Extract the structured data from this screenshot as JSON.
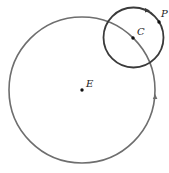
{
  "diagram": {
    "type": "orbital-circles",
    "colors": {
      "large_circle": "#6e6e6e",
      "small_circle": "#3a3a3a",
      "points": "#111111",
      "labels": "#222222",
      "background": "#ffffff"
    },
    "large_circle": {
      "cx": 82,
      "cy": 90,
      "r": 73,
      "center_label": "E"
    },
    "small_circle": {
      "cx": 133.5,
      "cy": 37.5,
      "r": 30,
      "center_label": "C"
    },
    "points": [
      {
        "name": "E",
        "x": 82,
        "y": 90,
        "label": "E",
        "label_x": 86,
        "label_y": 87
      },
      {
        "name": "C",
        "x": 133,
        "y": 38,
        "label": "C",
        "label_x": 137,
        "label_y": 35
      },
      {
        "name": "P",
        "x": 159,
        "y": 22,
        "label": "P",
        "label_x": 161,
        "label_y": 17
      }
    ],
    "arrows": [
      {
        "on": "small_circle",
        "x": 148,
        "y": 10,
        "direction": "counterclockwise"
      },
      {
        "on": "large_circle",
        "x": 155,
        "y": 97,
        "direction": "counterclockwise"
      }
    ]
  }
}
